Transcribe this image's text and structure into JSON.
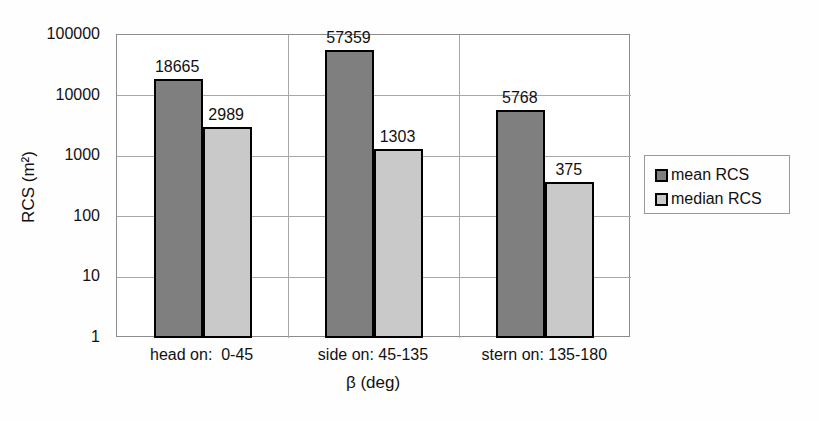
{
  "chart_data": {
    "type": "bar",
    "scale": "log",
    "title": "",
    "xlabel": "β (deg)",
    "ylabel": "RCS (m²)",
    "categories": [
      "head on:  0-45",
      "side on: 45-135",
      "stern on: 135-180"
    ],
    "series": [
      {
        "name": "mean RCS",
        "color": "#7f7f7f",
        "values": [
          18665,
          57359,
          5768
        ]
      },
      {
        "name": "median RCS",
        "color": "#c9c9c9",
        "values": [
          2989,
          1303,
          375
        ]
      }
    ],
    "ylim": [
      1,
      100000
    ],
    "yticks": [
      1,
      10,
      100,
      1000,
      10000,
      100000
    ],
    "ytick_labels": [
      "1",
      "10",
      "100",
      "1000",
      "10000",
      "100000"
    ],
    "grid": true,
    "legend_position": "right",
    "bar_border_color": "#000000",
    "grid_color": "#a8a8a8",
    "plot_border_color": "#8c8c8c",
    "background_color": "#fefefe"
  }
}
